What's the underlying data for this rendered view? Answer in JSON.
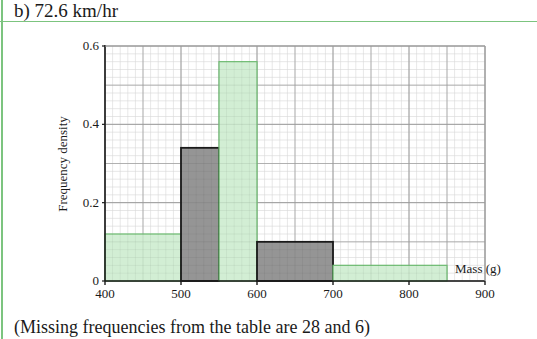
{
  "header": {
    "text": "b)  72.6 km/hr"
  },
  "footer": {
    "text": "(Missing frequencies from the table are 28 and 6)"
  },
  "colors": {
    "accent_rule": "#7cc47f",
    "green_bar_fill": "#cdeccf",
    "green_bar_stroke": "#6dbb71",
    "gray_bar_fill": "#8f8f8f",
    "gray_bar_stroke": "#1a1a1a",
    "grid_major": "#9a9a9a",
    "grid_minor": "#d6d6d6"
  },
  "chart_data": {
    "type": "bar",
    "subtype": "histogram",
    "title": "",
    "xlabel": "Mass (g)",
    "ylabel": "Frequency density",
    "xlim": [
      400,
      900
    ],
    "ylim": [
      0,
      0.6
    ],
    "x_ticks": [
      400,
      500,
      600,
      700,
      800,
      900
    ],
    "x_tick_labels": [
      "400",
      "500",
      "600",
      "700",
      "800",
      "900"
    ],
    "y_ticks": [
      0,
      0.2,
      0.4,
      0.6
    ],
    "y_tick_labels": [
      "0",
      "0.2",
      "0.4",
      "0.6"
    ],
    "grid": true,
    "legend": null,
    "bins": [
      {
        "x_start": 400,
        "x_end": 500,
        "frequency_density": 0.12,
        "style": "green"
      },
      {
        "x_start": 500,
        "x_end": 550,
        "frequency_density": 0.34,
        "style": "gray"
      },
      {
        "x_start": 550,
        "x_end": 600,
        "frequency_density": 0.56,
        "style": "green"
      },
      {
        "x_start": 600,
        "x_end": 700,
        "frequency_density": 0.1,
        "style": "gray"
      },
      {
        "x_start": 700,
        "x_end": 850,
        "frequency_density": 0.04,
        "style": "green"
      }
    ]
  }
}
